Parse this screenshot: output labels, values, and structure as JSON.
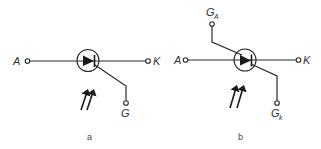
{
  "diagram": {
    "colors": {
      "ink": "#2a2a2a",
      "background": "#ffffff"
    },
    "panels": [
      {
        "caption": "a",
        "terminals": {
          "anode": "A",
          "cathode": "K",
          "gate": "G"
        },
        "light_arrows": 2
      },
      {
        "caption": "b",
        "terminals": {
          "anode": "A",
          "cathode": "K",
          "anode_gate": "G",
          "anode_gate_sub": "A",
          "cathode_gate": "G",
          "cathode_gate_sub": "k"
        },
        "light_arrows": 2
      }
    ]
  }
}
